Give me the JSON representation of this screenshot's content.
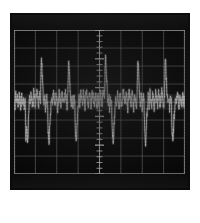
{
  "display": {
    "device_label": "oscilloscope-crt-display",
    "screen_title": "",
    "panel_color": "#0a0a0a",
    "screen_color": "#060606",
    "graticule_color": "#9a9a9a",
    "trace_color": "#d8d8d8",
    "tick_color": "#c8c8c8",
    "background_color": "#ffffff"
  },
  "chart_data": {
    "type": "line",
    "title": "",
    "subtitle": "",
    "xlabel": "",
    "ylabel": "",
    "grid": true,
    "legend": null,
    "legend_position": "none",
    "xlim": [
      0,
      8
    ],
    "ylim": [
      -4,
      4
    ],
    "x_divisions": 8,
    "y_divisions": 8,
    "center_axis_x": 4,
    "center_axis_ticks": 25,
    "tick_labels": [],
    "annotations": [],
    "series": [
      {
        "name": "trace-1",
        "color": "#d8d8d8",
        "x": [
          0.0,
          0.04,
          0.08,
          0.12,
          0.16,
          0.2,
          0.24,
          0.28,
          0.32,
          0.36,
          0.4,
          0.44,
          0.48,
          0.52,
          0.56,
          0.6,
          0.64,
          0.68,
          0.72,
          0.76,
          0.8,
          0.84,
          0.88,
          0.92,
          0.96,
          1.0,
          1.04,
          1.08,
          1.12,
          1.16,
          1.2,
          1.24,
          1.28,
          1.32,
          1.36,
          1.4,
          1.44,
          1.48,
          1.52,
          1.56,
          1.6,
          1.64,
          1.68,
          1.72,
          1.76,
          1.8,
          1.84,
          1.88,
          1.92,
          1.96,
          2.0,
          2.04,
          2.08,
          2.12,
          2.16,
          2.2,
          2.24,
          2.28,
          2.32,
          2.36,
          2.4,
          2.44,
          2.48,
          2.52,
          2.56,
          2.6,
          2.64,
          2.68,
          2.72,
          2.76,
          2.8,
          2.84,
          2.88,
          2.92,
          2.96,
          3.0,
          3.04,
          3.08,
          3.12,
          3.16,
          3.2,
          3.24,
          3.28,
          3.32,
          3.36,
          3.4,
          3.44,
          3.48,
          3.52,
          3.56,
          3.6,
          3.64,
          3.68,
          3.72,
          3.76,
          3.8,
          3.84,
          3.88,
          3.92,
          3.96,
          4.0,
          4.04,
          4.08,
          4.12,
          4.16,
          4.2,
          4.24,
          4.28,
          4.32,
          4.36,
          4.4,
          4.44,
          4.48,
          4.52,
          4.56,
          4.6,
          4.64,
          4.68,
          4.72,
          4.76,
          4.8,
          4.84,
          4.88,
          4.92,
          4.96,
          5.0,
          5.04,
          5.08,
          5.12,
          5.16,
          5.2,
          5.24,
          5.28,
          5.32,
          5.36,
          5.4,
          5.44,
          5.48,
          5.52,
          5.56,
          5.6,
          5.64,
          5.68,
          5.72,
          5.76,
          5.8,
          5.84,
          5.88,
          5.92,
          5.96,
          6.0,
          6.04,
          6.08,
          6.12,
          6.16,
          6.2,
          6.24,
          6.28,
          6.32,
          6.36,
          6.4,
          6.44,
          6.48,
          6.52,
          6.56,
          6.6,
          6.64,
          6.68,
          6.72,
          6.76,
          6.8,
          6.84,
          6.88,
          6.92,
          6.96,
          7.0,
          7.04,
          7.08,
          7.12,
          7.16,
          7.2,
          7.24,
          7.28,
          7.32,
          7.36,
          7.4,
          7.44,
          7.48,
          7.52,
          7.56,
          7.6,
          7.64,
          7.68,
          7.72,
          7.76,
          7.8,
          7.84,
          7.88,
          7.92,
          7.96,
          8.0
        ],
        "y": [
          0.1,
          -0.2,
          0.35,
          -0.15,
          0.25,
          -0.3,
          0.4,
          0.05,
          -0.25,
          0.3,
          -0.1,
          0.2,
          -0.35,
          0.15,
          -2.0,
          -1.2,
          -2.4,
          -0.9,
          0.3,
          -0.15,
          0.45,
          0.1,
          -0.3,
          0.55,
          0.2,
          -0.1,
          0.35,
          0.6,
          0.25,
          -0.2,
          0.4,
          0.15,
          2.6,
          1.4,
          0.5,
          -0.3,
          0.2,
          -0.45,
          0.35,
          0.1,
          -1.8,
          -2.2,
          -1.1,
          -0.4,
          0.3,
          -0.1,
          0.5,
          0.2,
          -0.25,
          0.4,
          0.15,
          -0.35,
          0.3,
          0.55,
          0.1,
          -0.2,
          0.45,
          0.25,
          -0.15,
          0.35,
          0.6,
          0.2,
          -0.3,
          0.4,
          2.55,
          1.3,
          0.45,
          -0.25,
          0.35,
          -0.4,
          0.2,
          0.1,
          -1.9,
          -2.3,
          -1.0,
          -0.35,
          0.25,
          -0.15,
          0.45,
          0.3,
          -0.2,
          0.5,
          0.15,
          -0.3,
          0.35,
          0.55,
          0.2,
          -0.1,
          0.4,
          0.25,
          -0.35,
          0.3,
          0.5,
          0.15,
          -0.25,
          0.45,
          0.2,
          -0.4,
          0.3,
          0.1,
          -0.2,
          0.55,
          0.25,
          -0.15,
          0.4,
          0.6,
          0.3,
          2.7,
          1.5,
          0.55,
          -0.2,
          0.35,
          -0.5,
          0.25,
          0.05,
          -1.7,
          -2.1,
          -1.3,
          -0.45,
          0.3,
          -0.1,
          0.45,
          0.2,
          -0.3,
          0.5,
          0.15,
          -0.25,
          0.35,
          0.6,
          0.25,
          -0.15,
          0.4,
          0.2,
          -0.35,
          0.3,
          0.55,
          0.1,
          -0.2,
          0.45,
          0.25,
          -0.4,
          0.35,
          0.15,
          -0.3,
          0.5,
          2.45,
          1.25,
          0.4,
          -0.3,
          0.25,
          -0.45,
          0.35,
          0.1,
          -1.85,
          -2.25,
          -1.15,
          -0.4,
          0.3,
          -0.15,
          0.5,
          0.2,
          -0.25,
          0.4,
          0.15,
          -0.35,
          0.3,
          0.55,
          0.2,
          -0.1,
          0.45,
          0.25,
          -0.3,
          0.35,
          0.6,
          0.15,
          -0.2,
          0.4,
          2.65,
          1.35,
          0.45,
          -0.25,
          0.3,
          -0.4,
          0.25,
          0.1,
          -1.75,
          -2.15,
          -1.05,
          -0.35,
          0.25,
          -0.15,
          0.45,
          0.2,
          -0.3,
          0.4,
          0.15,
          -0.25,
          0.35,
          0.2,
          -0.1,
          0.3
        ]
      }
    ]
  }
}
